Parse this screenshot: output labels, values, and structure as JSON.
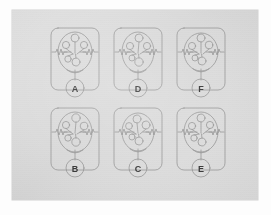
{
  "sheet": {
    "title": "",
    "background_color": "#ffffff",
    "card_color": "#dedede",
    "ink_color": "#8c8c8c",
    "label_color": "#3a3a3a",
    "description": "Scanned sheet with six hand-drawn schematic diagrams arranged in a 2-row by 3-column grid; each schematic sits inside a rounded rectangle panel and is identified by a letter inside a small circle at the bottom of the panel."
  },
  "grid": {
    "rows": 2,
    "columns": 3
  },
  "panels": [
    {
      "id": "panel-a",
      "label": "A",
      "row": 1,
      "column": 1,
      "left": 35,
      "top": 16,
      "diagram": {
        "outer_shape": "rounded-rectangle",
        "inner_shape": "ellipse",
        "node_count": 5,
        "has_left_zigzag": true,
        "has_right_zigzag": true,
        "has_bottom_stem": true
      }
    },
    {
      "id": "panel-d",
      "label": "D",
      "row": 1,
      "column": 2,
      "left": 98,
      "top": 16,
      "diagram": {
        "outer_shape": "rounded-rectangle",
        "inner_shape": "ellipse",
        "node_count": 5,
        "has_left_zigzag": true,
        "has_right_zigzag": true,
        "has_bottom_stem": true
      }
    },
    {
      "id": "panel-f",
      "label": "F",
      "row": 1,
      "column": 3,
      "left": 161,
      "top": 16,
      "diagram": {
        "outer_shape": "rounded-rectangle",
        "inner_shape": "ellipse",
        "node_count": 5,
        "has_left_zigzag": true,
        "has_right_zigzag": true,
        "has_bottom_stem": true
      }
    },
    {
      "id": "panel-b",
      "label": "B",
      "row": 2,
      "column": 1,
      "left": 35,
      "top": 96,
      "diagram": {
        "outer_shape": "rounded-rectangle",
        "inner_shape": "ellipse",
        "node_count": 5,
        "has_left_zigzag": true,
        "has_right_zigzag": true,
        "has_bottom_stem": true
      }
    },
    {
      "id": "panel-c",
      "label": "C",
      "row": 2,
      "column": 2,
      "left": 98,
      "top": 96,
      "diagram": {
        "outer_shape": "rounded-rectangle",
        "inner_shape": "ellipse",
        "node_count": 5,
        "has_left_zigzag": true,
        "has_right_zigzag": true,
        "has_bottom_stem": true
      }
    },
    {
      "id": "panel-e",
      "label": "E",
      "row": 2,
      "column": 3,
      "left": 161,
      "top": 96,
      "diagram": {
        "outer_shape": "rounded-rectangle",
        "inner_shape": "ellipse",
        "node_count": 5,
        "has_left_zigzag": true,
        "has_right_zigzag": true,
        "has_bottom_stem": true
      }
    }
  ]
}
